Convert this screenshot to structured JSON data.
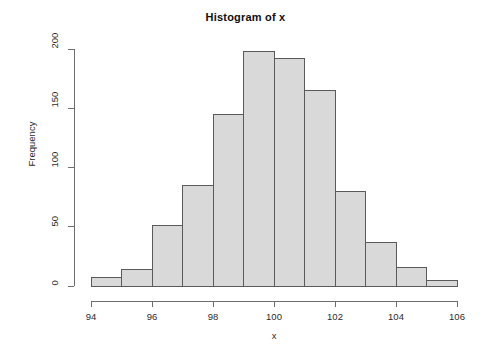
{
  "chart_data": {
    "type": "bar",
    "subtype": "histogram",
    "title": "Histogram of x",
    "xlabel": "x",
    "ylabel": "Frequency",
    "bin_width": 1,
    "bin_edges": [
      94,
      95,
      96,
      97,
      98,
      99,
      100,
      101,
      102,
      103,
      104,
      105,
      106
    ],
    "categories": [
      "94-95",
      "95-96",
      "96-97",
      "97-98",
      "98-99",
      "99-100",
      "100-101",
      "101-102",
      "102-103",
      "103-104",
      "104-105",
      "105-106"
    ],
    "values": [
      7,
      14,
      51,
      85,
      145,
      198,
      192,
      165,
      80,
      37,
      16,
      5
    ],
    "bin_midpoints": [
      94.5,
      95.5,
      96.5,
      97.5,
      98.5,
      99.5,
      100.5,
      101.5,
      102.5,
      103.5,
      104.5,
      105.5
    ],
    "xlim": [
      94,
      106
    ],
    "ylim": [
      0,
      200
    ],
    "xticks": [
      94,
      96,
      98,
      100,
      102,
      104,
      106
    ],
    "xtick_labels": [
      "94",
      "96",
      "98",
      "100",
      "102",
      "104",
      "106"
    ],
    "yticks": [
      0,
      50,
      100,
      150,
      200
    ],
    "ytick_labels": [
      "0",
      "50",
      "100",
      "150",
      "200"
    ],
    "grid": false,
    "legend": false,
    "bar_fill_color": "#d9d9d9",
    "bar_border_color": "#5a5a5a",
    "axis_color": "#6e6e6e",
    "text_color": "#2b2b2b",
    "background_color": "#ffffff"
  }
}
